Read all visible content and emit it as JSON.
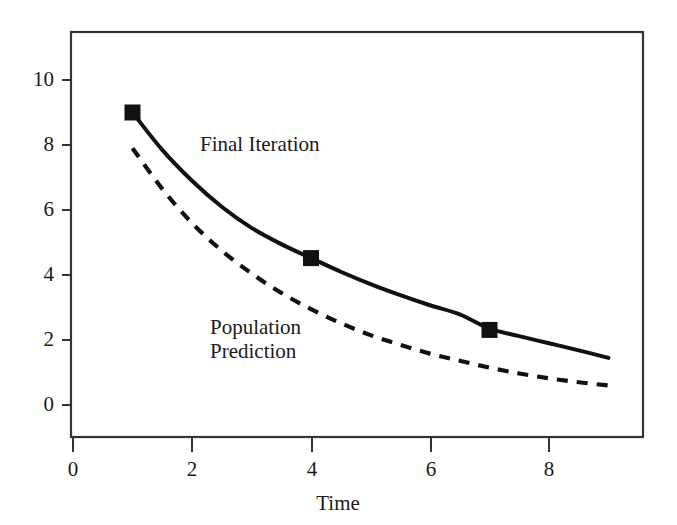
{
  "chart_data": {
    "type": "line",
    "title": "",
    "subtitle": "",
    "xlabel": "Time",
    "ylabel": "",
    "xlim": [
      0,
      9.7
    ],
    "ylim": [
      -1.6,
      11.5
    ],
    "xticks": [
      "0",
      "2",
      "4",
      "6",
      "8"
    ],
    "xtick_values": [
      0,
      2,
      4,
      6,
      8
    ],
    "yticks": [
      "0",
      "2",
      "4",
      "6",
      "8",
      "10"
    ],
    "ytick_values": [
      0,
      2,
      4,
      6,
      8,
      10
    ],
    "grid": false,
    "legend_position": "inline-annotations",
    "series": [
      {
        "name": "Final Iteration",
        "style": "solid",
        "color": "#111111",
        "marker": "filled-square",
        "x": [
          1,
          1.5,
          2,
          2.5,
          3,
          3.5,
          4,
          4.5,
          5,
          5.5,
          6,
          6.5,
          7,
          7.5,
          8,
          8.5,
          9
        ],
        "y": [
          9.0,
          7.85,
          6.9,
          6.1,
          5.45,
          4.95,
          4.52,
          4.1,
          3.72,
          3.38,
          3.07,
          2.79,
          2.35,
          2.12,
          1.9,
          1.68,
          1.45
        ],
        "marker_points": [
          {
            "x": 1,
            "y": 9.0
          },
          {
            "x": 4,
            "y": 4.52
          },
          {
            "x": 7,
            "y": 2.31
          }
        ],
        "annotation": "Final Iteration"
      },
      {
        "name": "Population Prediction",
        "style": "dashed",
        "color": "#111111",
        "marker": "none",
        "x": [
          1,
          1.5,
          2,
          2.5,
          3,
          3.5,
          4,
          4.5,
          5,
          5.5,
          6,
          6.5,
          7,
          7.5,
          8,
          8.5,
          9
        ],
        "y": [
          7.9,
          6.65,
          5.6,
          4.75,
          4.05,
          3.45,
          2.95,
          2.52,
          2.15,
          1.85,
          1.58,
          1.36,
          1.15,
          0.97,
          0.82,
          0.7,
          0.6
        ],
        "marker_points": [],
        "annotation": "Population\nPrediction"
      }
    ],
    "annotations": [
      {
        "text": "Final Iteration",
        "x_px": 200,
        "y_px": 132
      },
      {
        "text": "Population",
        "x_px": 210,
        "y_px": 315
      },
      {
        "text": "Prediction",
        "x_px": 210,
        "y_px": 339
      }
    ]
  },
  "axes": {
    "x_axis_title": "Time",
    "frame_color": "#333333"
  }
}
